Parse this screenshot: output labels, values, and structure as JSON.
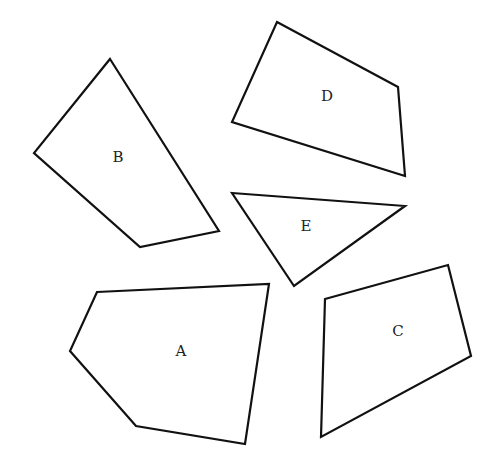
{
  "diagram": {
    "stroke_color": "#111111",
    "fill_color": "#ffffff",
    "shapes": [
      {
        "id": "A",
        "label": "A",
        "label_pos": [
          181,
          352
        ],
        "points": [
          [
            97,
            292
          ],
          [
            269,
            284
          ],
          [
            245,
            444
          ],
          [
            136,
            426
          ],
          [
            70,
            351
          ]
        ]
      },
      {
        "id": "B",
        "label": "B",
        "label_pos": [
          118,
          158
        ],
        "points": [
          [
            110,
            59
          ],
          [
            219,
            231
          ],
          [
            140,
            247
          ],
          [
            34,
            153
          ]
        ]
      },
      {
        "id": "C",
        "label": "C",
        "label_pos": [
          398,
          332
        ],
        "points": [
          [
            325,
            299
          ],
          [
            448,
            265
          ],
          [
            471,
            356
          ],
          [
            321,
            437
          ]
        ]
      },
      {
        "id": "D",
        "label": "D",
        "label_pos": [
          327,
          97
        ],
        "points": [
          [
            277,
            22
          ],
          [
            398,
            87
          ],
          [
            405,
            176
          ],
          [
            232,
            122
          ]
        ]
      },
      {
        "id": "E",
        "label": "E",
        "label_pos": [
          306,
          227
        ],
        "points": [
          [
            232,
            193
          ],
          [
            405,
            206
          ],
          [
            294,
            286
          ]
        ]
      }
    ]
  }
}
